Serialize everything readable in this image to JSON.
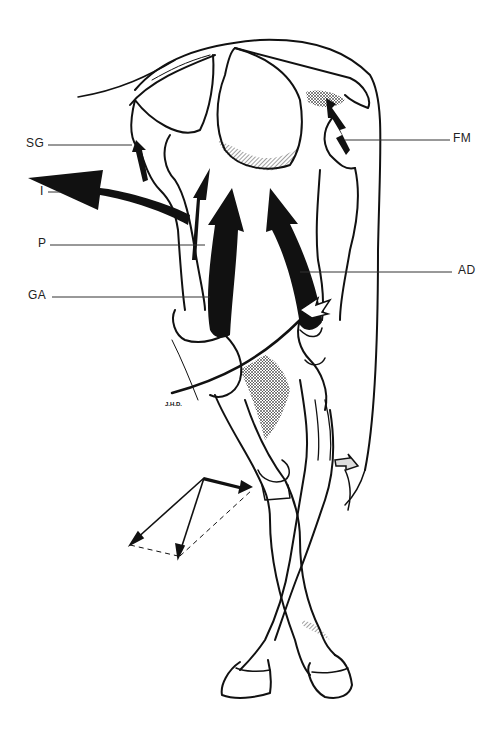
{
  "figure": {
    "signature": "J.H.D.",
    "labels": [
      {
        "id": "SG",
        "text": "SG",
        "side": "left"
      },
      {
        "id": "I",
        "text": "I",
        "side": "left"
      },
      {
        "id": "P",
        "text": "P",
        "side": "left"
      },
      {
        "id": "GA",
        "text": "GA",
        "side": "left"
      },
      {
        "id": "FM",
        "text": "FM",
        "side": "right"
      },
      {
        "id": "AD",
        "text": "AD",
        "side": "right"
      }
    ],
    "colors": {
      "ink": "#111111",
      "background": "#ffffff",
      "leader_line": "#333333"
    }
  }
}
